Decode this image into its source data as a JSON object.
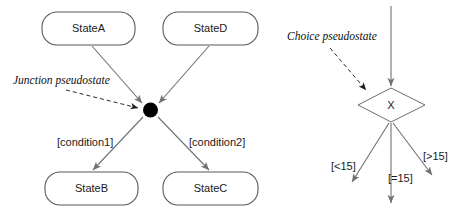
{
  "diagram": {
    "background_color": "#ffffff",
    "line_color": "#6e7275",
    "text_color": "#1a1a1a",
    "junction_dot_color": "#000000"
  },
  "junction_section": {
    "annotation": "Junction pseudostate",
    "source_states": [
      {
        "name": "StateA"
      },
      {
        "name": "StateD"
      }
    ],
    "target_states": [
      {
        "name": "StateB"
      },
      {
        "name": "StateC"
      }
    ],
    "guards": [
      {
        "text": "[condition1]"
      },
      {
        "text": "[condition2]"
      }
    ]
  },
  "choice_section": {
    "annotation": "Choice pseudostate",
    "diamond_label": "X",
    "guards": [
      {
        "text": "[<15]"
      },
      {
        "text": "[=15]"
      },
      {
        "text": "[>15]"
      }
    ]
  }
}
